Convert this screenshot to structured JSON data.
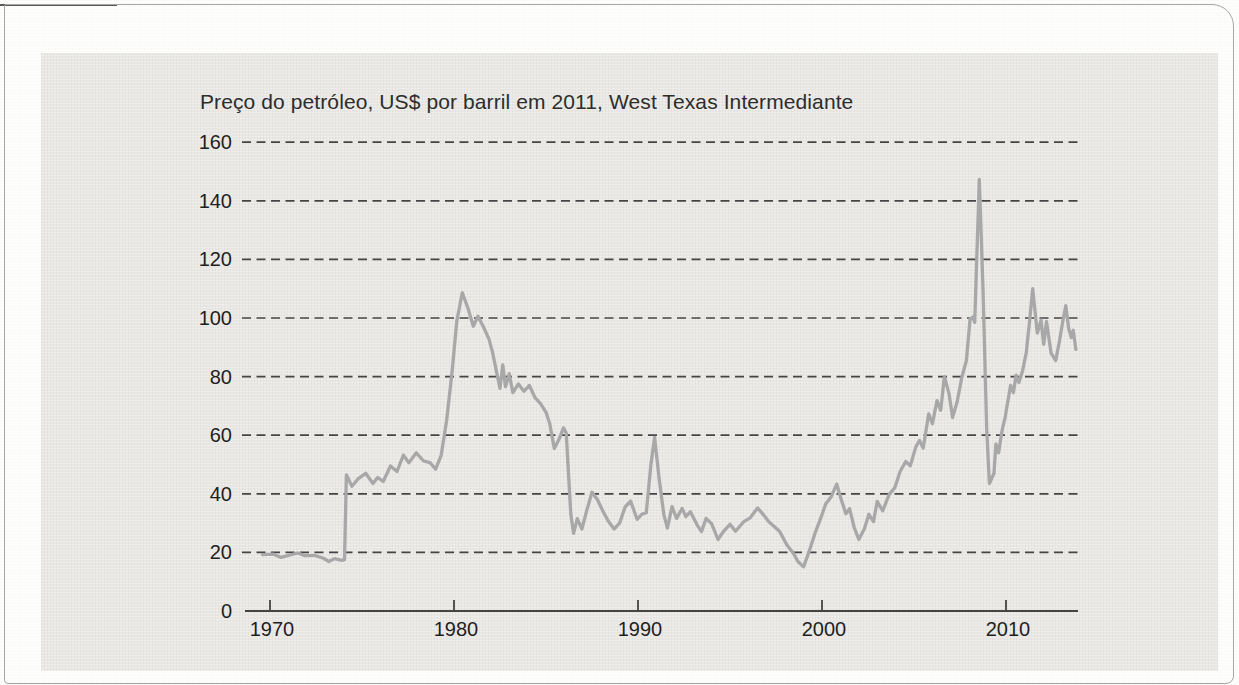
{
  "page": {
    "background": "#fefefd",
    "border_color": "#a6a6a6",
    "top_rule_color": "#5a5a5a",
    "panel_color": "#e9e8e4"
  },
  "chart_data": {
    "type": "line",
    "title": "Preço do petróleo, US$ por barril em 2011, West Texas Intermediante",
    "xlabel": "",
    "ylabel": "",
    "ylim": [
      0,
      160
    ],
    "xlim": [
      1968.6,
      2014.2
    ],
    "yticks": [
      0,
      20,
      40,
      60,
      80,
      100,
      120,
      140,
      160
    ],
    "xticks": [
      1970,
      1980,
      1990,
      2000,
      2010
    ],
    "grid": "horizontal-dashed",
    "legend": "none",
    "line_color": "#a8a8a8",
    "grid_color": "#454545",
    "axis_color": "#3f3f3f",
    "text_color": "#1f1f1f",
    "series": [
      {
        "name": "Preço real do petróleo WTI (US$ de 2011 por barril)",
        "points": [
          [
            1969.6,
            19.2
          ],
          [
            1970.2,
            19.4
          ],
          [
            1970.6,
            18.3
          ],
          [
            1971.1,
            19.1
          ],
          [
            1971.5,
            19.8
          ],
          [
            1971.9,
            18.9
          ],
          [
            1972.4,
            19.0
          ],
          [
            1972.9,
            18.0
          ],
          [
            1973.2,
            16.9
          ],
          [
            1973.5,
            17.9
          ],
          [
            1973.9,
            17.3
          ],
          [
            1974.05,
            17.5
          ],
          [
            1974.15,
            46.5
          ],
          [
            1974.45,
            42.6
          ],
          [
            1974.8,
            45.2
          ],
          [
            1975.2,
            47.0
          ],
          [
            1975.6,
            43.5
          ],
          [
            1975.85,
            45.6
          ],
          [
            1976.15,
            44.2
          ],
          [
            1976.55,
            49.5
          ],
          [
            1976.9,
            47.6
          ],
          [
            1977.25,
            53.2
          ],
          [
            1977.55,
            50.6
          ],
          [
            1977.95,
            54.0
          ],
          [
            1978.35,
            51.2
          ],
          [
            1978.7,
            50.6
          ],
          [
            1979.0,
            48.4
          ],
          [
            1979.3,
            53.0
          ],
          [
            1979.6,
            65.0
          ],
          [
            1979.9,
            82.0
          ],
          [
            1980.15,
            99.0
          ],
          [
            1980.45,
            108.6
          ],
          [
            1980.75,
            103.5
          ],
          [
            1981.05,
            97.2
          ],
          [
            1981.3,
            100.6
          ],
          [
            1981.6,
            97.0
          ],
          [
            1981.9,
            92.8
          ],
          [
            1982.1,
            88.2
          ],
          [
            1982.3,
            82.0
          ],
          [
            1982.5,
            76.0
          ],
          [
            1982.65,
            84.0
          ],
          [
            1982.8,
            76.5
          ],
          [
            1983.0,
            81.0
          ],
          [
            1983.2,
            74.5
          ],
          [
            1983.5,
            77.5
          ],
          [
            1983.8,
            75.0
          ],
          [
            1984.1,
            77.0
          ],
          [
            1984.4,
            72.8
          ],
          [
            1984.7,
            70.8
          ],
          [
            1985.0,
            67.8
          ],
          [
            1985.2,
            64.0
          ],
          [
            1985.45,
            55.5
          ],
          [
            1985.7,
            58.5
          ],
          [
            1985.95,
            62.5
          ],
          [
            1986.1,
            60.8
          ],
          [
            1986.35,
            33.0
          ],
          [
            1986.5,
            26.5
          ],
          [
            1986.7,
            31.5
          ],
          [
            1986.95,
            28.0
          ],
          [
            1987.2,
            34.0
          ],
          [
            1987.5,
            40.5
          ],
          [
            1987.8,
            38.0
          ],
          [
            1988.1,
            34.0
          ],
          [
            1988.4,
            30.5
          ],
          [
            1988.7,
            28.0
          ],
          [
            1989.0,
            30.0
          ],
          [
            1989.3,
            35.5
          ],
          [
            1989.6,
            37.5
          ],
          [
            1989.95,
            31.3
          ],
          [
            1990.2,
            33.0
          ],
          [
            1990.45,
            33.5
          ],
          [
            1990.7,
            50.0
          ],
          [
            1990.9,
            59.2
          ],
          [
            1991.15,
            45.0
          ],
          [
            1991.4,
            33.0
          ],
          [
            1991.6,
            28.3
          ],
          [
            1991.85,
            35.6
          ],
          [
            1992.1,
            31.6
          ],
          [
            1992.4,
            35.0
          ],
          [
            1992.6,
            32.2
          ],
          [
            1992.85,
            33.9
          ],
          [
            1993.2,
            29.5
          ],
          [
            1993.45,
            27.1
          ],
          [
            1993.7,
            31.6
          ],
          [
            1994.0,
            29.8
          ],
          [
            1994.35,
            24.4
          ],
          [
            1994.65,
            27.2
          ],
          [
            1995.0,
            29.6
          ],
          [
            1995.3,
            27.2
          ],
          [
            1995.75,
            30.5
          ],
          [
            1996.1,
            31.8
          ],
          [
            1996.5,
            35.2
          ],
          [
            1996.8,
            33.0
          ],
          [
            1997.1,
            30.5
          ],
          [
            1997.7,
            27.1
          ],
          [
            1998.1,
            22.5
          ],
          [
            1998.45,
            19.6
          ],
          [
            1998.7,
            16.8
          ],
          [
            1999.0,
            15.1
          ],
          [
            1999.3,
            20.3
          ],
          [
            1999.65,
            27.1
          ],
          [
            1999.95,
            32.0
          ],
          [
            2000.2,
            36.5
          ],
          [
            2000.5,
            39.0
          ],
          [
            2000.8,
            43.3
          ],
          [
            2001.05,
            38.0
          ],
          [
            2001.3,
            33.2
          ],
          [
            2001.5,
            34.9
          ],
          [
            2001.75,
            28.5
          ],
          [
            2002.0,
            24.4
          ],
          [
            2002.3,
            28.0
          ],
          [
            2002.55,
            33.0
          ],
          [
            2002.8,
            30.5
          ],
          [
            2003.0,
            37.4
          ],
          [
            2003.3,
            34.2
          ],
          [
            2003.65,
            39.8
          ],
          [
            2003.95,
            42.0
          ],
          [
            2004.25,
            47.7
          ],
          [
            2004.55,
            51.0
          ],
          [
            2004.8,
            49.6
          ],
          [
            2005.1,
            56.0
          ],
          [
            2005.3,
            58.2
          ],
          [
            2005.5,
            55.6
          ],
          [
            2005.8,
            67.3
          ],
          [
            2006.0,
            63.9
          ],
          [
            2006.25,
            71.8
          ],
          [
            2006.45,
            68.5
          ],
          [
            2006.65,
            80.0
          ],
          [
            2006.9,
            74.2
          ],
          [
            2007.1,
            66.0
          ],
          [
            2007.35,
            71.5
          ],
          [
            2007.6,
            79.7
          ],
          [
            2007.85,
            85.5
          ],
          [
            2008.05,
            99.8
          ],
          [
            2008.2,
            100.3
          ],
          [
            2008.3,
            98.5
          ],
          [
            2008.55,
            147.3
          ],
          [
            2008.75,
            110.0
          ],
          [
            2008.95,
            62.0
          ],
          [
            2009.1,
            43.5
          ],
          [
            2009.35,
            47.0
          ],
          [
            2009.45,
            57.0
          ],
          [
            2009.6,
            54.0
          ],
          [
            2009.8,
            62.0
          ],
          [
            2009.95,
            66.0
          ],
          [
            2010.1,
            71.5
          ],
          [
            2010.25,
            77.0
          ],
          [
            2010.4,
            74.5
          ],
          [
            2010.55,
            80.5
          ],
          [
            2010.7,
            78.0
          ],
          [
            2010.9,
            82.0
          ],
          [
            2011.1,
            88.0
          ],
          [
            2011.3,
            100.0
          ],
          [
            2011.45,
            110.0
          ],
          [
            2011.7,
            94.8
          ],
          [
            2011.9,
            99.3
          ],
          [
            2012.05,
            91.0
          ],
          [
            2012.2,
            98.8
          ],
          [
            2012.45,
            88.0
          ],
          [
            2012.7,
            85.5
          ],
          [
            2012.9,
            92.0
          ],
          [
            2013.1,
            99.3
          ],
          [
            2013.25,
            104.2
          ],
          [
            2013.4,
            96.5
          ],
          [
            2013.55,
            93.3
          ],
          [
            2013.65,
            95.8
          ],
          [
            2013.8,
            89.3
          ]
        ]
      }
    ]
  }
}
